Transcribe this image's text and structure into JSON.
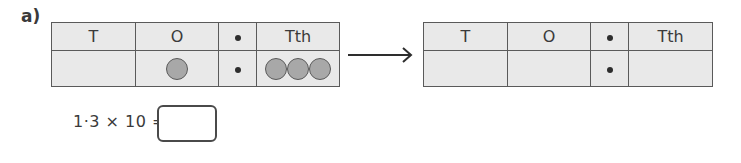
{
  "question": {
    "label": "a)",
    "equation": "1·3 × 10 =",
    "answer_value": ""
  },
  "left_table": {
    "headers": [
      "T",
      "O",
      "•",
      "Tth"
    ],
    "row": {
      "T": 0,
      "O": 1,
      "decimal_point": "•",
      "Tth": 3
    }
  },
  "right_table": {
    "headers": [
      "T",
      "O",
      "•",
      "Tth"
    ],
    "row": {
      "T": "",
      "O": "",
      "decimal_point": "•",
      "Tth": ""
    }
  },
  "arrow": {
    "icon": "right-arrow-icon"
  },
  "colors": {
    "cell_background": "#e9e9e9",
    "grid_lines": "#5a5a5a",
    "counter_fill": "#a8a8a8",
    "text": "#3a3a3a"
  }
}
